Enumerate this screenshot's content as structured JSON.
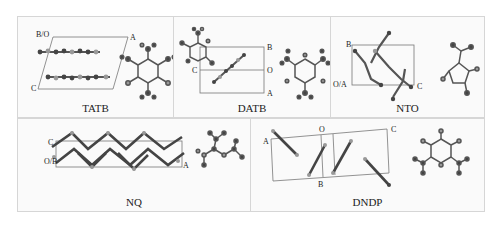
{
  "figure": {
    "panels": [
      {
        "id": "tatb",
        "caption": "TATB",
        "axis_labels": [
          "B/O",
          "A",
          "C"
        ]
      },
      {
        "id": "datb",
        "caption": "DATB",
        "axis_labels": [
          "B",
          "C",
          "O",
          "A"
        ]
      },
      {
        "id": "nto",
        "caption": "NTO",
        "axis_labels": [
          "B",
          "O/A",
          "C"
        ]
      },
      {
        "id": "nq",
        "caption": "NQ",
        "axis_labels": [
          "C",
          "O/B",
          "A"
        ]
      },
      {
        "id": "dndp",
        "caption": "DNDP",
        "axis_labels": [
          "A",
          "O",
          "C",
          "B"
        ]
      }
    ]
  },
  "colors": {
    "atom_dark": "#3a3a3a",
    "atom_light": "#9a9a9a",
    "bond": "#555555",
    "cell": "#666666",
    "border": "#d6d6d6"
  }
}
